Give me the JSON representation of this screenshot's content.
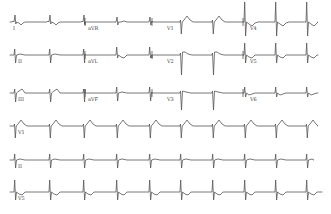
{
  "figure": {
    "background": "#ffffff",
    "trace_color": "#555555"
  },
  "layout": {
    "rows": [
      {
        "baseline": 22,
        "leads": [
          {
            "name": "I",
            "label": "I",
            "x0": 10,
            "x1": 85,
            "label_x": 13,
            "morph": "upright_small",
            "beats": [
              15,
              50,
              84
            ]
          },
          {
            "name": "aVR",
            "label": "aVR",
            "x0": 85,
            "x1": 152,
            "label_x": 88,
            "morph": "avr",
            "beats": [
              117,
              150
            ]
          },
          {
            "name": "V1",
            "label": "V1",
            "x0": 152,
            "x1": 243,
            "label_x": 167,
            "morph": "v1",
            "beats": [
              181,
              213
            ]
          },
          {
            "name": "V4",
            "label": "V4",
            "x0": 243,
            "x1": 318,
            "label_x": 250,
            "morph": "v4",
            "beats": [
              245,
              276,
              307
            ]
          }
        ]
      },
      {
        "baseline": 55,
        "leads": [
          {
            "name": "II",
            "label": "II",
            "x0": 10,
            "x1": 85,
            "label_x": 18,
            "morph": "inferior",
            "beats": [
              15,
              50,
              84
            ]
          },
          {
            "name": "aVL",
            "label": "aVL",
            "x0": 85,
            "x1": 152,
            "label_x": 88,
            "morph": "avl",
            "beats": [
              117,
              150
            ]
          },
          {
            "name": "V2",
            "label": "V2",
            "x0": 152,
            "x1": 243,
            "label_x": 167,
            "morph": "v2",
            "beats": [
              181,
              213
            ]
          },
          {
            "name": "V5",
            "label": "V5",
            "x0": 243,
            "x1": 318,
            "label_x": 250,
            "morph": "v5",
            "beats": [
              245,
              276,
              307
            ]
          }
        ]
      },
      {
        "baseline": 93,
        "leads": [
          {
            "name": "III",
            "label": "III",
            "x0": 10,
            "x1": 85,
            "label_x": 18,
            "morph": "iii",
            "beats": [
              15,
              50,
              84
            ]
          },
          {
            "name": "aVF",
            "label": "aVF",
            "x0": 85,
            "x1": 152,
            "label_x": 88,
            "morph": "inferior",
            "beats": [
              117,
              150
            ]
          },
          {
            "name": "V3",
            "label": "V3",
            "x0": 152,
            "x1": 243,
            "label_x": 167,
            "morph": "v3",
            "beats": [
              181,
              213
            ]
          },
          {
            "name": "V6",
            "label": "V6",
            "x0": 243,
            "x1": 318,
            "label_x": 250,
            "morph": "v6",
            "beats": [
              245,
              276,
              307
            ]
          }
        ]
      }
    ],
    "rhythm_strips": [
      {
        "name": "V1",
        "label": "V1",
        "baseline": 126,
        "x0": 10,
        "x1": 318,
        "label_x": 18,
        "morph": "v1"
      },
      {
        "name": "II",
        "label": "II",
        "baseline": 160,
        "x0": 10,
        "x1": 314,
        "label_x": 18,
        "morph": "inferior"
      },
      {
        "name": "V5",
        "label": "V5",
        "baseline": 192,
        "x0": 10,
        "x1": 322,
        "label_x": 18,
        "morph": "v5"
      }
    ],
    "beat_positions": [
      15,
      50,
      84,
      117,
      150,
      181,
      213,
      245,
      276,
      307
    ],
    "lead_separators_x": [
      85,
      152,
      243
    ]
  },
  "labels": {
    "row1": [
      "I",
      "aVR",
      "V1",
      "V4"
    ],
    "row2": [
      "II",
      "aVL",
      "V2",
      "V5"
    ],
    "row3": [
      "III",
      "aVF",
      "V3",
      "V6"
    ],
    "rhythm": [
      "V1",
      "II",
      "V5"
    ]
  }
}
